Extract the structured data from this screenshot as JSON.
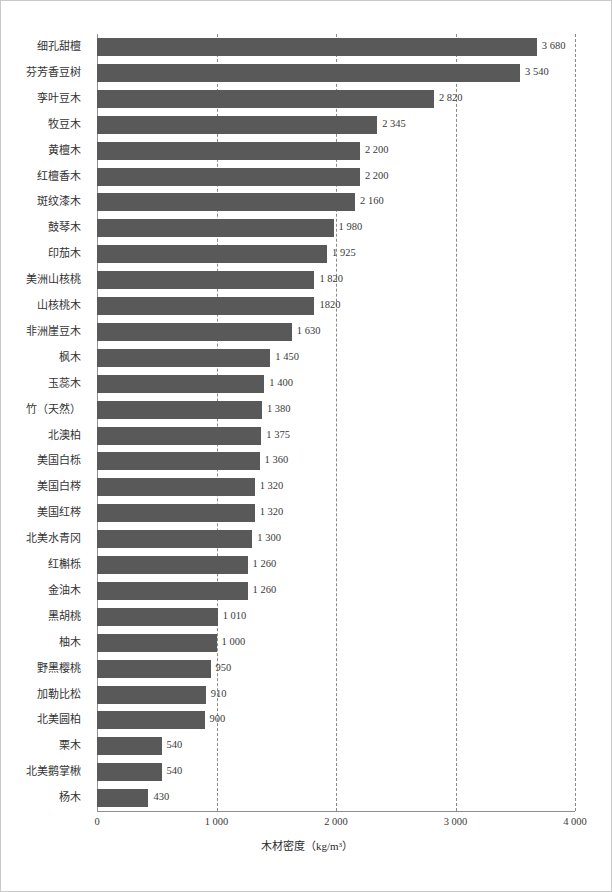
{
  "chart_data": {
    "type": "bar",
    "orientation": "horizontal",
    "title": "",
    "xlabel": "木材密度（kg/m³）",
    "ylabel": "",
    "xlim": [
      0,
      4000
    ],
    "xticks": [
      0,
      1000,
      2000,
      3000,
      4000
    ],
    "xtick_labels": [
      "0",
      "1 000",
      "2 000",
      "3 000",
      "4 000"
    ],
    "grid": "vertical-dashed",
    "legend": "none",
    "bar_color": "#595959",
    "categories": [
      "细孔甜檀",
      "芬芳香豆树",
      "孪叶豆木",
      "牧豆木",
      "黄檀木",
      "红檀香木",
      "斑纹漆木",
      "鼓琴木",
      "印茄木",
      "美洲山核桃",
      "山核桃木",
      "非洲崖豆木",
      "枫木",
      "玉蕊木",
      "竹（天然）",
      "北澳柏",
      "美国白栎",
      "美国白梣",
      "美国红梣",
      "北美水青冈",
      "红槲栎",
      "金油木",
      "黑胡桃",
      "柚木",
      "野黑樱桃",
      "加勒比松",
      "北美圆柏",
      "栗木",
      "北美鹅掌楸",
      "杨木"
    ],
    "values": [
      3680,
      3540,
      2820,
      2345,
      2200,
      2200,
      2160,
      1980,
      1925,
      1820,
      1820,
      1630,
      1450,
      1400,
      1380,
      1375,
      1360,
      1320,
      1320,
      1300,
      1260,
      1260,
      1010,
      1000,
      950,
      910,
      900,
      540,
      540,
      430
    ],
    "value_labels": [
      "3 680",
      "3 540",
      "2 820",
      "2 345",
      "2 200",
      "2 200",
      "2 160",
      "1 980",
      "1 925",
      "1 820",
      "1820",
      "1 630",
      "1 450",
      "1 400",
      "1 380",
      "1 375",
      "1 360",
      "1 320",
      "1 320",
      "1 300",
      "1 260",
      "1 260",
      "1 010",
      "1 000",
      "950",
      "910",
      "900",
      "540",
      "540",
      "430"
    ]
  }
}
